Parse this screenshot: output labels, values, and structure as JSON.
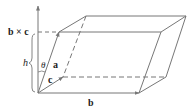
{
  "diagram": {
    "labels": {
      "normal": "b × c",
      "height": "h",
      "angle": "θ",
      "vec_a": "a",
      "vec_b": "b",
      "vec_c": "c"
    },
    "colors": {
      "line": "#777777",
      "text": "#222222"
    }
  }
}
